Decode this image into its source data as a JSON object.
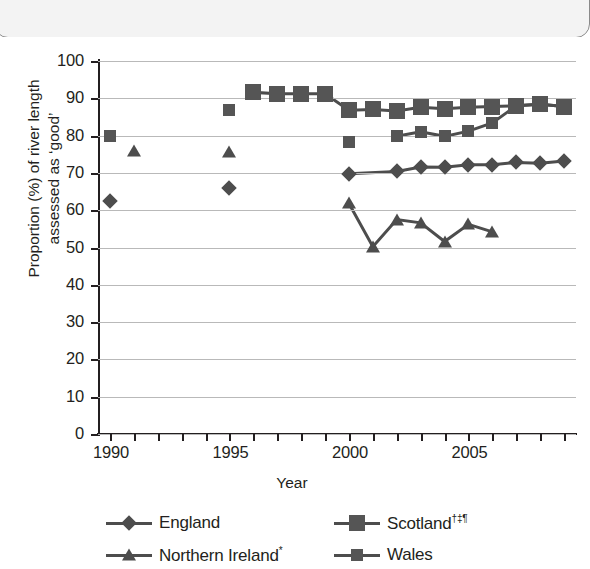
{
  "chart_data": {
    "type": "line",
    "title": "",
    "xlabel": "Year",
    "ylabel_line1": "Proportion (%) of river length",
    "ylabel_line2": "assessed as ‘good’",
    "ylim": [
      0,
      100
    ],
    "ytick_step": 10,
    "yticks": [
      0,
      10,
      20,
      30,
      40,
      50,
      60,
      70,
      80,
      90,
      100
    ],
    "xlim": [
      1989.5,
      2009.5
    ],
    "xticks_all": [
      1990,
      1991,
      1992,
      1993,
      1994,
      1995,
      1996,
      1997,
      1998,
      1999,
      2000,
      2001,
      2002,
      2003,
      2004,
      2005,
      2006,
      2007,
      2008,
      2009
    ],
    "xtick_labels": [
      {
        "x": 1990,
        "label": "1990"
      },
      {
        "x": 1995,
        "label": "1995"
      },
      {
        "x": 2000,
        "label": "2000"
      },
      {
        "x": 2005,
        "label": "2005"
      }
    ],
    "grid": true,
    "legend_position": "bottom",
    "marker_color": "#4d4d4d",
    "series": [
      {
        "name": "England",
        "legend_label": "England",
        "marker": "diamond",
        "points": [
          {
            "x": 1990,
            "y": 62.5,
            "connect": false
          },
          {
            "x": 1995,
            "y": 66,
            "connect": false
          },
          {
            "x": 2000,
            "y": 69.8,
            "connect": false
          },
          {
            "x": 2002,
            "y": 70.4,
            "connect": true
          },
          {
            "x": 2003,
            "y": 71.6,
            "connect": true
          },
          {
            "x": 2004,
            "y": 71.5,
            "connect": true
          },
          {
            "x": 2005,
            "y": 72.2,
            "connect": true
          },
          {
            "x": 2006,
            "y": 72.2,
            "connect": true
          },
          {
            "x": 2007,
            "y": 72.8,
            "connect": true
          },
          {
            "x": 2008,
            "y": 72.6,
            "connect": true
          },
          {
            "x": 2009,
            "y": 73.2,
            "connect": true
          }
        ]
      },
      {
        "name": "Northern Ireland*",
        "legend_label": "Northern Ireland",
        "legend_label_sup": "*",
        "marker": "triangle",
        "points": [
          {
            "x": 1991,
            "y": 76,
            "connect": false
          },
          {
            "x": 1995,
            "y": 75.5,
            "connect": false
          },
          {
            "x": 2000,
            "y": 61.8,
            "connect": false
          },
          {
            "x": 2001,
            "y": 50.2,
            "connect": true
          },
          {
            "x": 2002,
            "y": 57.5,
            "connect": true
          },
          {
            "x": 2003,
            "y": 56.6,
            "connect": true
          },
          {
            "x": 2004,
            "y": 51.6,
            "connect": true
          },
          {
            "x": 2005,
            "y": 56.2,
            "connect": true
          },
          {
            "x": 2006,
            "y": 54.2,
            "connect": true
          }
        ]
      },
      {
        "name": "Scotland",
        "legend_label": "Scotland",
        "legend_label_sup": "†‡¶",
        "marker": "square-large",
        "points": [
          {
            "x": 1996,
            "y": 91.6,
            "connect": false
          },
          {
            "x": 1997,
            "y": 91.2,
            "connect": true
          },
          {
            "x": 1998,
            "y": 91.2,
            "connect": true
          },
          {
            "x": 1999,
            "y": 91.2,
            "connect": true
          },
          {
            "x": 2000,
            "y": 86.8,
            "connect": true
          },
          {
            "x": 2001,
            "y": 87.0,
            "connect": true
          },
          {
            "x": 2002,
            "y": 86.6,
            "connect": true
          },
          {
            "x": 2003,
            "y": 87.6,
            "connect": true
          },
          {
            "x": 2004,
            "y": 87.2,
            "connect": true
          },
          {
            "x": 2005,
            "y": 87.6,
            "connect": true
          },
          {
            "x": 2006,
            "y": 87.8,
            "connect": true
          },
          {
            "x": 2007,
            "y": 88.0,
            "connect": true
          },
          {
            "x": 2008,
            "y": 88.4,
            "connect": true
          },
          {
            "x": 2009,
            "y": 87.8,
            "connect": true
          }
        ]
      },
      {
        "name": "Wales",
        "legend_label": "Wales",
        "marker": "square-small",
        "points": [
          {
            "x": 1990,
            "y": 80.0,
            "connect": false
          },
          {
            "x": 1995,
            "y": 86.8,
            "connect": false
          },
          {
            "x": 2000,
            "y": 78.4,
            "connect": false
          },
          {
            "x": 2002,
            "y": 79.8,
            "connect": false
          },
          {
            "x": 2003,
            "y": 81.0,
            "connect": true
          },
          {
            "x": 2004,
            "y": 79.8,
            "connect": true
          },
          {
            "x": 2005,
            "y": 81.2,
            "connect": true
          },
          {
            "x": 2006,
            "y": 83.4,
            "connect": true
          },
          {
            "x": 2007,
            "y": 88.0,
            "connect": true
          },
          {
            "x": 2008,
            "y": 88.4,
            "connect": true
          },
          {
            "x": 2009,
            "y": 87.8,
            "connect": true
          }
        ]
      }
    ]
  }
}
